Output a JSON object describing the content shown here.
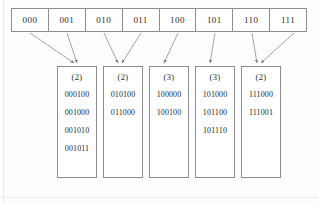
{
  "diagram": {
    "kind": "extendible-hashing-directory-and-buckets",
    "colors": {
      "line": "#8d8d8d",
      "text": "#2a2a2a",
      "background": "#fdfdfd",
      "cell_fill": "#ffffff"
    },
    "directory": {
      "cells": [
        {
          "label": "000"
        },
        {
          "label": "001"
        },
        {
          "label": "010"
        },
        {
          "label": "011"
        },
        {
          "label": "100"
        },
        {
          "label": "101"
        },
        {
          "label": "110"
        },
        {
          "label": "111"
        }
      ]
    },
    "buckets": [
      {
        "depth_label": "(2)",
        "entries": [
          "000100",
          "001000",
          "001010",
          "001011"
        ]
      },
      {
        "depth_label": "(2)",
        "entries": [
          "010100",
          "011000"
        ]
      },
      {
        "depth_label": "(3)",
        "entries": [
          "100000",
          "100100"
        ]
      },
      {
        "depth_label": "(3)",
        "entries": [
          "101000",
          "101100",
          "101110"
        ]
      },
      {
        "depth_label": "(2)",
        "entries": [
          "111000",
          "111001"
        ]
      }
    ],
    "pointers": [
      {
        "from_cell": "000",
        "to_bucket": 0
      },
      {
        "from_cell": "001",
        "to_bucket": 0
      },
      {
        "from_cell": "010",
        "to_bucket": 1
      },
      {
        "from_cell": "011",
        "to_bucket": 1
      },
      {
        "from_cell": "100",
        "to_bucket": 2
      },
      {
        "from_cell": "101",
        "to_bucket": 3
      },
      {
        "from_cell": "110",
        "to_bucket": 4
      },
      {
        "from_cell": "111",
        "to_bucket": 4
      }
    ]
  }
}
